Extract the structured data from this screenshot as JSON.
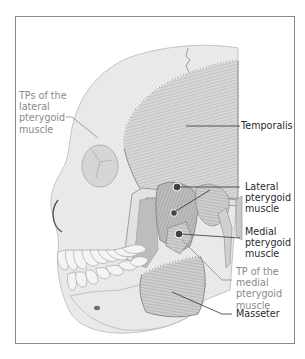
{
  "figure": {
    "colors": {
      "frame": "#8a8a8a",
      "primary_label": "#2a2a2a",
      "trigger_point_label": "#8a8a8a",
      "trigger_point_dot": "#444444",
      "bone": "#e6e6e6",
      "muscle": "#c4c4c4"
    }
  },
  "labels": {
    "tps_lateral_pterygoid": "TPs of the\nlateral\npterygoid\nmuscle",
    "temporalis": "Temporalis",
    "lateral_pterygoid": "Lateral\npterygoid\nmuscle",
    "medial_pterygoid": "Medial\npterygoid\nmuscle",
    "tp_medial_pterygoid": "TP of the\nmedial\npterygoid\nmuscle",
    "masseter": "Masseter"
  },
  "trigger_points": [
    {
      "muscle": "lateral pterygoid",
      "x": 177,
      "y": 187
    },
    {
      "muscle": "lateral pterygoid",
      "x": 174,
      "y": 213
    },
    {
      "muscle": "medial pterygoid",
      "x": 179,
      "y": 234
    }
  ]
}
